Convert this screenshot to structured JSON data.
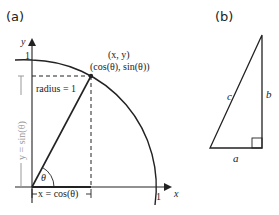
{
  "panel_a": {
    "label": "(a)",
    "axis_y_label": "y",
    "axis_x_label": "x",
    "tick_y_one": "1",
    "tick_x_one": "1",
    "point_label_xy": "(x, y)",
    "point_label_trig": "(cos(θ), sin(θ))",
    "radius_label": "radius = 1",
    "angle_label": "θ",
    "vertical_measure_label": "y = sin(θ)",
    "horizontal_measure_label": "x = cos(θ)"
  },
  "panel_b": {
    "label": "(b)",
    "hypotenuse_label": "c",
    "vertical_side_label": "b",
    "horizontal_side_label": "a"
  },
  "colors": {
    "line": "#222222",
    "measure": "#999999",
    "text": "#222222"
  }
}
